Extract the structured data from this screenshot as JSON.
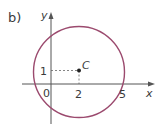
{
  "part_label": "b)",
  "axes": {
    "x_label": "x",
    "y_label": "y",
    "origin_label": "0"
  },
  "point": {
    "name": "C",
    "x": 2,
    "y": 1
  },
  "ticks": {
    "x_center": "2",
    "y_center": "1",
    "x_intercept": "5"
  },
  "circle": {
    "center": [
      2,
      1
    ],
    "passes_through": [
      5,
      0
    ],
    "color": "#9b4a6e"
  },
  "colors": {
    "axis": "#555555",
    "circle": "#9b4a6e",
    "text": "#3a3a3a"
  }
}
